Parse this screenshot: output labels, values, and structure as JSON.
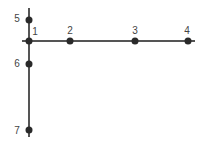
{
  "diagram": {
    "type": "node-graph",
    "line_color": "#555555",
    "node_color": "#2a2a2a",
    "label_color": "#444444",
    "horizontal_axis": {
      "x1": 22,
      "x2": 195,
      "y": 41
    },
    "vertical_axis": {
      "x": 29,
      "y1": 8,
      "y2": 137
    },
    "nodes": [
      {
        "id": "1",
        "label": "1",
        "x": 29,
        "y": 41,
        "label_x": 35,
        "label_y": 32
      },
      {
        "id": "2",
        "label": "2",
        "x": 70,
        "y": 41,
        "label_x": 70,
        "label_y": 31
      },
      {
        "id": "3",
        "label": "3",
        "x": 135,
        "y": 41,
        "label_x": 135,
        "label_y": 31
      },
      {
        "id": "4",
        "label": "4",
        "x": 188,
        "y": 41,
        "label_x": 187,
        "label_y": 31
      },
      {
        "id": "5",
        "label": "5",
        "x": 29,
        "y": 20,
        "label_x": 17,
        "label_y": 19
      },
      {
        "id": "6",
        "label": "6",
        "x": 29,
        "y": 64,
        "label_x": 17,
        "label_y": 64
      },
      {
        "id": "7",
        "label": "7",
        "x": 29,
        "y": 130,
        "label_x": 17,
        "label_y": 131
      }
    ]
  }
}
